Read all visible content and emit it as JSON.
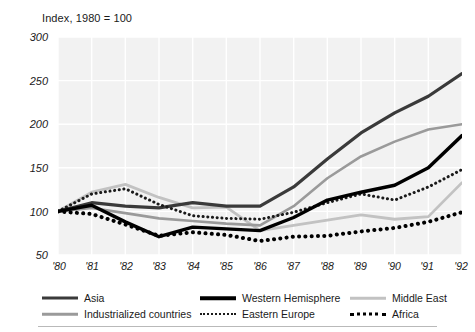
{
  "figure": {
    "axis_title": "Index, 1980 = 100"
  },
  "chart_data": {
    "type": "line",
    "title": "Index, 1980 = 100",
    "xlabel": "",
    "ylabel": "Index, 1980 = 100",
    "grid": true,
    "legend_position": "bottom",
    "xlim": [
      "'80",
      "'92"
    ],
    "ylim": [
      50,
      300
    ],
    "yticks": [
      300,
      250,
      200,
      150,
      100,
      50
    ],
    "ytick_labels": [
      "300",
      "250",
      "200",
      "150",
      "100",
      "50"
    ],
    "categories": [
      "'80",
      "'81",
      "'82",
      "'83",
      "'84",
      "'85",
      "'86",
      "'87",
      "'88",
      "'89",
      "'90",
      "'91",
      "'92"
    ],
    "series": [
      {
        "name": "Asia",
        "style": "solid",
        "color": "#3a3a3a",
        "width": 3.2,
        "values": [
          100,
          110,
          106,
          104,
          110,
          106,
          106,
          128,
          160,
          190,
          213,
          232,
          258
        ]
      },
      {
        "name": "Industrialized countries",
        "style": "solid",
        "color": "#9a9a9a",
        "width": 2.6,
        "values": [
          100,
          104,
          98,
          92,
          89,
          86,
          84,
          106,
          138,
          163,
          180,
          194,
          200
        ]
      },
      {
        "name": "Western Hemisphere",
        "style": "solid",
        "color": "#000000",
        "width": 3.4,
        "values": [
          100,
          107,
          88,
          71,
          82,
          80,
          78,
          93,
          113,
          122,
          130,
          150,
          187
        ]
      },
      {
        "name": "Eastern Europe",
        "style": "dotted-fine",
        "color": "#1a1a1a",
        "width": 3.0,
        "values": [
          100,
          120,
          126,
          108,
          95,
          92,
          91,
          99,
          110,
          120,
          113,
          128,
          148
        ]
      },
      {
        "name": "Middle East",
        "style": "solid",
        "color": "#c2c2c2",
        "width": 2.8,
        "values": [
          100,
          122,
          131,
          116,
          104,
          105,
          78,
          84,
          90,
          96,
          91,
          94,
          133
        ]
      },
      {
        "name": "Africa",
        "style": "dotted-bold",
        "color": "#000000",
        "width": 4.0,
        "values": [
          100,
          97,
          85,
          72,
          76,
          73,
          66,
          71,
          72,
          77,
          81,
          88,
          99
        ]
      }
    ]
  },
  "legend": [
    {
      "label": "Asia",
      "swatch": "line-solid-dark-swatch",
      "key": "asia"
    },
    {
      "label": "Western Hemisphere",
      "swatch": "line-solid-black-swatch",
      "key": "western-hemisphere"
    },
    {
      "label": "Middle East",
      "swatch": "line-solid-lightgray-swatch",
      "key": "middle-east"
    },
    {
      "label": "Industrialized countries",
      "swatch": "line-solid-gray-swatch",
      "key": "industrialized-countries"
    },
    {
      "label": "Eastern Europe",
      "swatch": "line-dotted-fine-swatch",
      "key": "eastern-europe"
    },
    {
      "label": "Africa",
      "swatch": "line-dotted-bold-swatch",
      "key": "africa"
    }
  ]
}
